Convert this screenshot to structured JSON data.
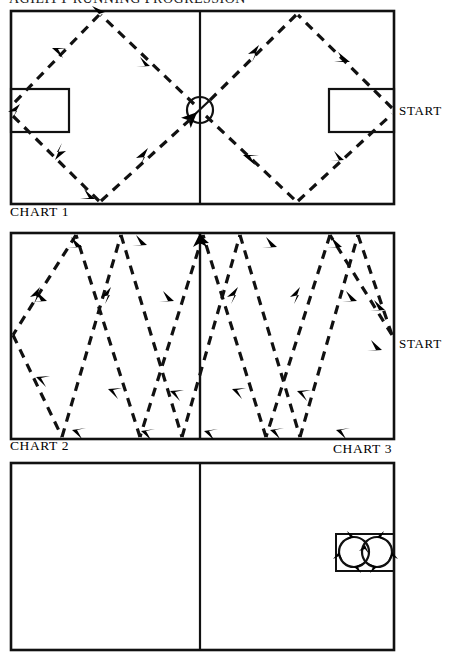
{
  "document": {
    "title": "AGILITY RUNNING PROGRESSION",
    "page_background": "#ffffff",
    "ink_color": "#000000"
  },
  "charts": [
    {
      "id": "chart-1",
      "caption": "CHART 1",
      "start_label": "START",
      "pattern": "diamond-crossing",
      "description": "Full court with center circle and two end boxes; dashed diagonal paths form two diamonds crossing at the center circle.",
      "features": {
        "center_circle": true,
        "center_line": true,
        "left_goal_box": true,
        "right_goal_box": true
      },
      "geometry": {
        "x": 11,
        "y": 11,
        "width": 383,
        "height": 193,
        "center_line_x": 200,
        "circle_cx": 200,
        "circle_cy": 110,
        "circle_r": 13,
        "left_box": {
          "x": 11,
          "y": 89,
          "width": 58,
          "height": 43
        },
        "right_box": {
          "x": 329,
          "y": 89,
          "width": 65,
          "height": 43
        }
      },
      "paths": [
        {
          "from": [
            394,
            110
          ],
          "to": [
            296,
            13
          ],
          "arrow": "mid-forward"
        },
        {
          "from": [
            296,
            13
          ],
          "to": [
            201,
            110
          ],
          "arrow": "mid-forward"
        },
        {
          "from": [
            201,
            110
          ],
          "to": [
            296,
            203
          ],
          "arrow": "mid-forward"
        },
        {
          "from": [
            296,
            203
          ],
          "to": [
            394,
            110
          ],
          "arrow": "mid-forward"
        },
        {
          "from": [
            199,
            110
          ],
          "to": [
            99,
            13
          ],
          "arrow": "mid-forward"
        },
        {
          "from": [
            99,
            13
          ],
          "to": [
            11,
            110
          ],
          "arrow": "mid-forward"
        },
        {
          "from": [
            11,
            110
          ],
          "to": [
            99,
            203
          ],
          "arrow": "mid-forward"
        },
        {
          "from": [
            99,
            203
          ],
          "to": [
            199,
            110
          ],
          "arrow": "mid-forward"
        }
      ]
    },
    {
      "id": "chart-2-3",
      "caption_left": "CHART 2",
      "caption_right": "CHART 3",
      "start_label": "START",
      "pattern": "zigzag-shuttle",
      "description": "Full court with center line; dashed zigzag paths run baseline to baseline in both directions across the whole court.",
      "features": {
        "center_circle": false,
        "center_line": true,
        "left_goal_box": false,
        "right_goal_box": false
      },
      "geometry": {
        "x": 11,
        "y": 233,
        "width": 383,
        "height": 206,
        "center_line_x": 200,
        "peaks_top": [
          75,
          138,
          200,
          265,
          330
        ],
        "peaks_bottom": [
          44,
          107,
          170,
          232,
          297,
          360
        ]
      }
    },
    {
      "id": "chart-4",
      "caption": "",
      "pattern": "figure-eight-circles",
      "description": "Full court with center line; a small rectangle on the right side contains two adjoining circles traced with arrowheads (figure-eight drill).",
      "features": {
        "center_circle": false,
        "center_line": true,
        "drill_box": true,
        "circles": 2
      },
      "geometry": {
        "x": 11,
        "y": 463,
        "width": 383,
        "height": 187,
        "center_line_x": 200,
        "drill_box": {
          "x": 336,
          "y": 534,
          "width": 58,
          "height": 37
        },
        "circle_left": {
          "cx": 354,
          "cy": 552,
          "r": 15
        },
        "circle_right": {
          "cx": 378,
          "cy": 552,
          "r": 15
        }
      }
    }
  ]
}
